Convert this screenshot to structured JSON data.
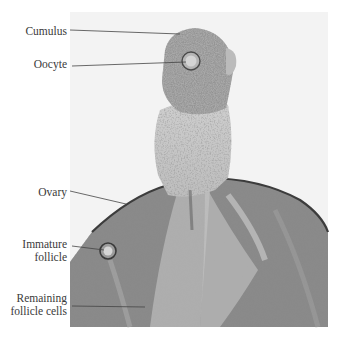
{
  "figure": {
    "type": "labeled micrograph",
    "labels": [
      {
        "id": "cumulus",
        "lines": [
          "Cumulus"
        ]
      },
      {
        "id": "oocyte",
        "lines": [
          "Oocyte"
        ]
      },
      {
        "id": "ovary",
        "lines": [
          "Ovary"
        ]
      },
      {
        "id": "immature_follicle",
        "lines": [
          "Immature",
          "follicle"
        ]
      },
      {
        "id": "remaining_follicle_cells",
        "lines": [
          "Remaining",
          "follicle cells"
        ]
      }
    ],
    "colors": {
      "background": "#ffffff",
      "frame": "#f2f2f2",
      "tissue_dark": "#5a5a5a",
      "tissue_light": "#c8c8c8",
      "leader_line": "#444444",
      "label_text": "#3a3a3a"
    }
  }
}
